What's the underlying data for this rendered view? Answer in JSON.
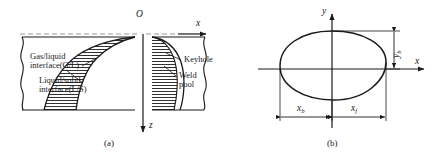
{
  "figure": {
    "panels": [
      {
        "id": "a",
        "caption": "(a)",
        "view": "longitudinal cross-section of keyhole and weld pool",
        "axes": {
          "origin_label": "O",
          "horizontal_label": "x",
          "vertical_label": "z",
          "horizontal_direction": "right",
          "vertical_direction": "down",
          "dashed_guide": true
        },
        "annotations": [
          {
            "name": "gas-liquid-interface",
            "line1": "Gas/liquid",
            "line2": "interface(G/L)"
          },
          {
            "name": "liquid-solid-interface",
            "line1": "Liquid/solid",
            "line2": "interface(L/S)"
          },
          {
            "name": "keyhole",
            "line1": "Keyhole"
          },
          {
            "name": "weld-pool",
            "line1": "Weld",
            "line2": "pool"
          }
        ],
        "hatch": {
          "style": "horizontal-lines",
          "spacing_px": 3,
          "color": "#1a1a1a"
        }
      },
      {
        "id": "b",
        "caption": "(b)",
        "view": "top view of weld pool boundary (x-y plane)",
        "axes": {
          "horizontal_label": "x",
          "vertical_label": "y",
          "horizontal_direction": "right",
          "vertical_direction": "up"
        },
        "shape": "egg-shaped closed pool boundary",
        "dimensions": [
          {
            "name": "x-b",
            "symbol": "x",
            "subscript": "b",
            "orientation": "horizontal",
            "side": "left-of-origin"
          },
          {
            "name": "x-f",
            "symbol": "x",
            "subscript": "f",
            "orientation": "horizontal",
            "side": "right-of-origin"
          },
          {
            "name": "y-b",
            "symbol": "y",
            "subscript": "b",
            "orientation": "vertical",
            "side": "right"
          }
        ]
      }
    ],
    "colors": {
      "stroke": "#1a1a1a",
      "background": "#ffffff",
      "dashed": "#8a8a8a"
    }
  }
}
